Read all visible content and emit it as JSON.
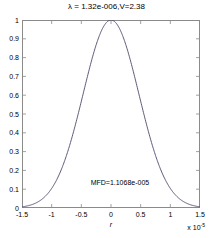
{
  "chart_data": {
    "type": "line",
    "title": "λ = 1.32e-006,V=2.38",
    "xlabel": "r",
    "ylabel": "",
    "x_exponent_prefix": "x 10",
    "x_exponent_value": "-5",
    "xlim": [
      -1.5,
      1.5
    ],
    "ylim": [
      0,
      1
    ],
    "x_scale_factor": 1e-05,
    "xticks": [
      -1.5,
      -1,
      -0.5,
      0,
      0.5,
      1,
      1.5
    ],
    "xtick_labels": [
      "-1.5",
      "-1",
      "-0.5",
      "0",
      "0.5",
      "1",
      "1.5"
    ],
    "yticks": [
      0,
      0.1,
      0.2,
      0.3,
      0.4,
      0.5,
      0.6,
      0.7,
      0.8,
      0.9,
      1
    ],
    "ytick_labels": [
      "0",
      "0.1",
      "0.2",
      "0.3",
      "0.4",
      "0.5",
      "0.6",
      "0.7",
      "0.8",
      "0.9",
      "1"
    ],
    "grid": false,
    "legend": null,
    "line_color": "#4a4a6a",
    "frame_color": "#8a8a8a",
    "background": "#ffffff",
    "series": [
      {
        "name": "field-profile",
        "peak_x": 0,
        "peak_y": 1,
        "mfd": 1.1068e-05,
        "hwhm_scaled": 0.5534,
        "x": [
          -1.5,
          -1.4,
          -1.3,
          -1.2,
          -1.1,
          -1.0,
          -0.9,
          -0.8,
          -0.7,
          -0.6,
          -0.5,
          -0.4,
          -0.3,
          -0.2,
          -0.1,
          0,
          0.1,
          0.2,
          0.3,
          0.4,
          0.5,
          0.6,
          0.7,
          0.8,
          0.9,
          1.0,
          1.1,
          1.2,
          1.3,
          1.4,
          1.5
        ],
        "values": [
          0.0004,
          0.0014,
          0.0044,
          0.0125,
          0.0321,
          0.0746,
          0.1567,
          0.2982,
          0.5132,
          0.8001,
          1.1294,
          1.4401,
          1.6601,
          1.7398,
          1.6477,
          1.4142,
          1.1005,
          0.7745,
          0.4932,
          0.2843,
          0.1485,
          0.0703,
          0.0301,
          0.0117,
          0.0041,
          0.0013,
          0.0004,
          0.0001,
          0.0,
          0.0,
          0.0
        ]
      }
    ],
    "annotations": [
      {
        "name": "mfd-label",
        "text": "MFD=1.1068e-005",
        "x": -0.36,
        "y": 0.135
      }
    ]
  }
}
